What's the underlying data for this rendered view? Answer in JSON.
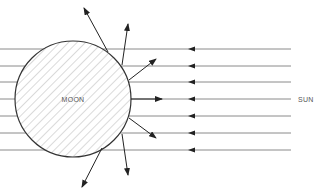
{
  "diagram": {
    "labels": {
      "moon": "MOON",
      "sun": "SUN"
    },
    "colors": {
      "background": "#ffffff",
      "outline": "#333333",
      "hatch": "#b5b5b5",
      "ray": "#8a8a8a",
      "arrow": "#222222",
      "text": "#555555"
    },
    "moon": {
      "cx": 73,
      "cy": 99,
      "r": 58
    },
    "incoming_rays": {
      "y": [
        49,
        66,
        82,
        99,
        116,
        133,
        150
      ],
      "x_start": 291,
      "arrowhead_x": 188
    },
    "reflected_rays": [
      {
        "from": [
          108,
          52
        ],
        "to": [
          84,
          8
        ]
      },
      {
        "from": [
          122,
          65
        ],
        "to": [
          128,
          24
        ]
      },
      {
        "from": [
          129,
          80
        ],
        "to": [
          156,
          59
        ]
      },
      {
        "from": [
          131,
          99
        ],
        "to": [
          162,
          99
        ]
      },
      {
        "from": [
          129,
          118
        ],
        "to": [
          156,
          138
        ]
      },
      {
        "from": [
          122,
          134
        ],
        "to": [
          128,
          175
        ]
      },
      {
        "from": [
          102,
          148
        ],
        "to": [
          82,
          187
        ]
      }
    ]
  }
}
